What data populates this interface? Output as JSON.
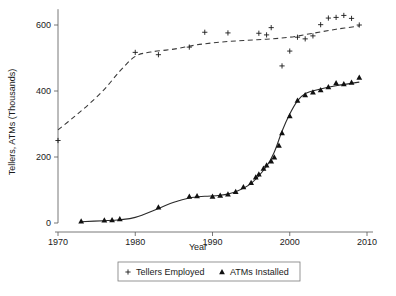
{
  "chart_data": {
    "type": "scatter",
    "title": "",
    "xlabel": "Year",
    "ylabel": "Tellers, ATMs (Thousands)",
    "xlim": [
      1968,
      2011
    ],
    "ylim": [
      -25,
      660
    ],
    "xticks": [
      1970,
      1980,
      1990,
      2000,
      2010
    ],
    "xtick_labels": [
      "1970",
      "1980",
      "1990",
      "2000",
      "2010"
    ],
    "yticks": [
      0,
      200,
      400,
      600
    ],
    "ytick_labels": [
      "0",
      "200",
      "400",
      "600"
    ],
    "grid": false,
    "legend_position": "below-center",
    "series": [
      {
        "name": "Tellers Employed",
        "marker": "plus",
        "trend": "dashed",
        "points": [
          {
            "x": 1970,
            "y": 250
          },
          {
            "x": 1980,
            "y": 517
          },
          {
            "x": 1983,
            "y": 510
          },
          {
            "x": 1987,
            "y": 533
          },
          {
            "x": 1989,
            "y": 578
          },
          {
            "x": 1992,
            "y": 576
          },
          {
            "x": 1996,
            "y": 575
          },
          {
            "x": 1997,
            "y": 570
          },
          {
            "x": 1997.6,
            "y": 592
          },
          {
            "x": 1999,
            "y": 476
          },
          {
            "x": 2000,
            "y": 521
          },
          {
            "x": 2001,
            "y": 563
          },
          {
            "x": 2002,
            "y": 558
          },
          {
            "x": 2003,
            "y": 567
          },
          {
            "x": 2004,
            "y": 601
          },
          {
            "x": 2005,
            "y": 621
          },
          {
            "x": 2006,
            "y": 623
          },
          {
            "x": 2007,
            "y": 629
          },
          {
            "x": 2008,
            "y": 620
          },
          {
            "x": 2009,
            "y": 600
          }
        ],
        "trend_points": [
          {
            "x": 1970,
            "y": 282
          },
          {
            "x": 1972,
            "y": 320
          },
          {
            "x": 1974,
            "y": 360
          },
          {
            "x": 1976,
            "y": 405
          },
          {
            "x": 1978,
            "y": 460
          },
          {
            "x": 1980,
            "y": 505
          },
          {
            "x": 1982,
            "y": 518
          },
          {
            "x": 1985,
            "y": 527
          },
          {
            "x": 1988,
            "y": 540
          },
          {
            "x": 1991,
            "y": 548
          },
          {
            "x": 1994,
            "y": 553
          },
          {
            "x": 1997,
            "y": 557
          },
          {
            "x": 2000,
            "y": 563
          },
          {
            "x": 2003,
            "y": 575
          },
          {
            "x": 2006,
            "y": 587
          },
          {
            "x": 2009,
            "y": 597
          }
        ]
      },
      {
        "name": "ATMs Installed",
        "marker": "triangle",
        "trend": "solid",
        "points": [
          {
            "x": 1973,
            "y": 5
          },
          {
            "x": 1976,
            "y": 8
          },
          {
            "x": 1977,
            "y": 9
          },
          {
            "x": 1978,
            "y": 12
          },
          {
            "x": 1983,
            "y": 48
          },
          {
            "x": 1987,
            "y": 80
          },
          {
            "x": 1988,
            "y": 82
          },
          {
            "x": 1990,
            "y": 80
          },
          {
            "x": 1991,
            "y": 83
          },
          {
            "x": 1992,
            "y": 87
          },
          {
            "x": 1993,
            "y": 95
          },
          {
            "x": 1994,
            "y": 109
          },
          {
            "x": 1995,
            "y": 122
          },
          {
            "x": 1995.6,
            "y": 139
          },
          {
            "x": 1996,
            "y": 148
          },
          {
            "x": 1996.6,
            "y": 165
          },
          {
            "x": 1997,
            "y": 175
          },
          {
            "x": 1997.6,
            "y": 187
          },
          {
            "x": 1998,
            "y": 199
          },
          {
            "x": 1998.6,
            "y": 235
          },
          {
            "x": 1999,
            "y": 273
          },
          {
            "x": 2000,
            "y": 324
          },
          {
            "x": 2001,
            "y": 371
          },
          {
            "x": 2002,
            "y": 388
          },
          {
            "x": 2003,
            "y": 396
          },
          {
            "x": 2004,
            "y": 403
          },
          {
            "x": 2005,
            "y": 412
          },
          {
            "x": 2006,
            "y": 424
          },
          {
            "x": 2007,
            "y": 421
          },
          {
            "x": 2008,
            "y": 426
          },
          {
            "x": 2009,
            "y": 441
          }
        ],
        "trend_points": [
          {
            "x": 1973,
            "y": 4
          },
          {
            "x": 1976,
            "y": 7
          },
          {
            "x": 1978,
            "y": 10
          },
          {
            "x": 1980,
            "y": 17
          },
          {
            "x": 1983,
            "y": 44
          },
          {
            "x": 1985,
            "y": 63
          },
          {
            "x": 1987,
            "y": 76
          },
          {
            "x": 1989,
            "y": 81
          },
          {
            "x": 1991,
            "y": 84
          },
          {
            "x": 1993,
            "y": 95
          },
          {
            "x": 1995,
            "y": 120
          },
          {
            "x": 1997,
            "y": 172
          },
          {
            "x": 1998,
            "y": 215
          },
          {
            "x": 1999,
            "y": 278
          },
          {
            "x": 2000,
            "y": 330
          },
          {
            "x": 2001,
            "y": 370
          },
          {
            "x": 2002,
            "y": 392
          },
          {
            "x": 2004,
            "y": 406
          },
          {
            "x": 2006,
            "y": 416
          },
          {
            "x": 2009,
            "y": 427
          }
        ]
      }
    ],
    "legend": [
      {
        "label": "Tellers Employed",
        "marker": "plus"
      },
      {
        "label": "ATMs Installed",
        "marker": "triangle"
      }
    ],
    "colors": {
      "tellers_marker": "#1a1a1a",
      "tellers_trend": "#3a3a3a",
      "atms_marker": "#111111",
      "atms_trend": "#2a2a2a",
      "axis": "#555555",
      "legend_border": "#7a7a7a",
      "background": "#ffffff"
    }
  }
}
